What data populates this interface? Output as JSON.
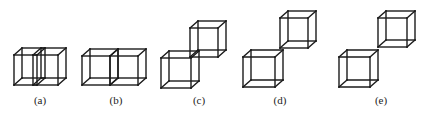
{
  "figure": {
    "stroke_color": "#1a1a1a",
    "depth_offset": [
      8,
      -7
    ],
    "panels": [
      {
        "id": "a",
        "label": "(a)",
        "label_x": 40,
        "description": "two overlapping cubes side by side",
        "cubes": [
          {
            "x": 14,
            "y": 55,
            "w": 23,
            "h": 30
          },
          {
            "x": 33,
            "y": 55,
            "w": 25,
            "h": 30
          }
        ]
      },
      {
        "id": "b",
        "label": "(b)",
        "label_x": 116,
        "description": "two cubes sharing a face",
        "cubes": [
          {
            "x": 82,
            "y": 56,
            "w": 28,
            "h": 29
          },
          {
            "x": 110,
            "y": 56,
            "w": 28,
            "h": 29
          }
        ]
      },
      {
        "id": "c",
        "label": "(c)",
        "label_x": 199,
        "description": "two cubes sharing an edge, diagonal",
        "cubes": [
          {
            "x": 161,
            "y": 58,
            "w": 30,
            "h": 30
          },
          {
            "x": 190,
            "y": 28,
            "w": 28,
            "h": 29
          }
        ]
      },
      {
        "id": "d",
        "label": "(d)",
        "label_x": 280,
        "description": "two cubes sharing a vertex",
        "cubes": [
          {
            "x": 243,
            "y": 57,
            "w": 32,
            "h": 30
          },
          {
            "x": 280,
            "y": 18,
            "w": 28,
            "h": 30
          }
        ]
      },
      {
        "id": "e",
        "label": "(e)",
        "label_x": 381,
        "description": "two separated cubes",
        "cubes": [
          {
            "x": 339,
            "y": 57,
            "w": 31,
            "h": 30
          },
          {
            "x": 378,
            "y": 18,
            "w": 29,
            "h": 29
          }
        ]
      }
    ]
  }
}
